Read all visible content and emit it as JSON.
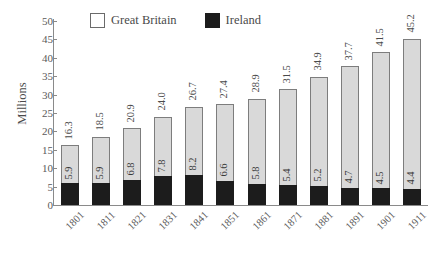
{
  "chart_data": {
    "type": "bar",
    "stacked": true,
    "title": "",
    "xlabel": "",
    "ylabel": "Millions",
    "ylim": [
      0,
      50
    ],
    "yticks": [
      0,
      5,
      10,
      15,
      20,
      25,
      30,
      35,
      40,
      45,
      50
    ],
    "grid": false,
    "legend_position": "top",
    "categories": [
      "1801",
      "1811",
      "1821",
      "1831",
      "1841",
      "1851",
      "1861",
      "1871",
      "1881",
      "1891",
      "1901",
      "1911"
    ],
    "series": [
      {
        "name": "Great Britain",
        "color": "#d9d9d9",
        "note": "labels shown are the stacked column totals printed above each bar",
        "values": [
          16.3,
          18.5,
          20.9,
          24.0,
          26.7,
          27.4,
          28.9,
          31.5,
          34.9,
          37.7,
          41.5,
          45.2
        ]
      },
      {
        "name": "Ireland",
        "color": "#1c1c1c",
        "values": [
          5.9,
          5.9,
          6.8,
          7.8,
          8.2,
          6.6,
          5.8,
          5.4,
          5.2,
          4.7,
          4.5,
          4.4
        ]
      }
    ],
    "total_labels": [
      "16.3",
      "18.5",
      "20.9",
      "24.0",
      "26.7",
      "27.4",
      "28.9",
      "31.5",
      "34.9",
      "37.7",
      "41.5",
      "45.2"
    ],
    "ireland_labels": [
      "5.9",
      "5.9",
      "6.8",
      "7.8",
      "8.2",
      "6.6",
      "5.8",
      "5.4",
      "5.2",
      "4.7",
      "4.5",
      "4.4"
    ]
  },
  "legend": {
    "items": [
      {
        "label": "Great Britain",
        "color": "#d9d9d9"
      },
      {
        "label": "Ireland",
        "color": "#1c1c1c"
      }
    ]
  },
  "axes": {
    "y_title": "Millions",
    "y_tick_labels": [
      "0",
      "5",
      "10",
      "15",
      "20",
      "25",
      "30",
      "35",
      "40",
      "45",
      "50"
    ],
    "x_tick_labels": [
      "1801",
      "1811",
      "1821",
      "1831",
      "1841",
      "1851",
      "1861",
      "1871",
      "1881",
      "1891",
      "1901",
      "1911"
    ]
  }
}
